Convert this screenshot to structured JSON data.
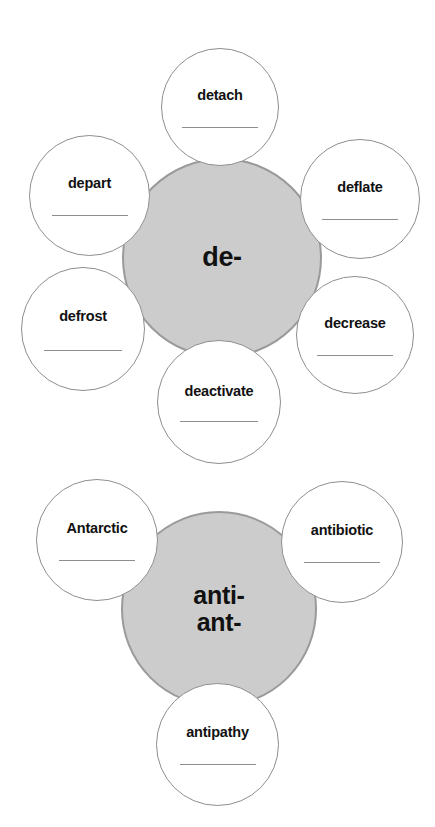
{
  "worksheet": {
    "type": "prefix word web worksheet",
    "diagrams": [
      {
        "id": "de",
        "center": {
          "prefix_lines": [
            "de-"
          ],
          "fill_color": "#cccccc",
          "border_color": "#9a9a9a"
        },
        "words": [
          {
            "label": "detach",
            "position": "top"
          },
          {
            "label": "depart",
            "position": "upper-left"
          },
          {
            "label": "deflate",
            "position": "upper-right"
          },
          {
            "label": "defrost",
            "position": "lower-left"
          },
          {
            "label": "decrease",
            "position": "lower-right"
          },
          {
            "label": "deactivate",
            "position": "bottom"
          }
        ]
      },
      {
        "id": "anti",
        "center": {
          "prefix_lines": [
            "anti-",
            "ant-"
          ],
          "fill_color": "#cccccc",
          "border_color": "#9a9a9a"
        },
        "words": [
          {
            "label": "Antarctic",
            "position": "upper-left"
          },
          {
            "label": "antibiotic",
            "position": "upper-right"
          },
          {
            "label": "antipathy",
            "position": "bottom"
          }
        ]
      }
    ]
  }
}
